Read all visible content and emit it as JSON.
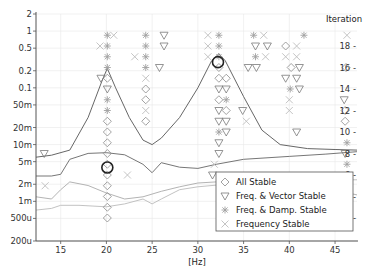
{
  "chart_data": {
    "type": "scatter",
    "title": "",
    "xlabel": "[Hz]",
    "ylabel": "",
    "y2label": "Iteration",
    "xlim": [
      12.3,
      47.4
    ],
    "ylim_log": [
      0.0002,
      2
    ],
    "y2lim": [
      0,
      20
    ],
    "grid": true,
    "legend_position": "lower right (inside)",
    "x_ticks": [
      15,
      20,
      25,
      30,
      35,
      40,
      45
    ],
    "x_tick_labels": [
      "15",
      "20",
      "25",
      "30",
      "35",
      "40",
      "45"
    ],
    "y_ticks": [
      2,
      1,
      0.5,
      0.2,
      0.1,
      0.05,
      0.02,
      0.01,
      0.005,
      0.002,
      0.001,
      0.0005,
      0.0002
    ],
    "y_tick_labels": [
      "2",
      "1",
      "0.5",
      "0.2",
      "0.1",
      "50m",
      "20m",
      "10m",
      "5m",
      "2m",
      "1m",
      "500u",
      "200u"
    ],
    "y2_ticks": [
      2,
      4,
      6,
      8,
      10,
      12,
      14,
      16,
      18
    ],
    "y2_tick_labels": [
      "2 -",
      "4 -",
      "6 -",
      "8 -",
      "10 -",
      "12 -",
      "14 -",
      "16 -",
      "18 -"
    ],
    "legend": [
      {
        "symbol": "diamond",
        "label": "All Stable"
      },
      {
        "symbol": "triangle-down",
        "label": "Freq. & Vector Stable"
      },
      {
        "symbol": "asterisk",
        "label": "Freq. & Damp. Stable"
      },
      {
        "symbol": "cross",
        "label": "Frequency Stable"
      }
    ],
    "curves": [
      {
        "name": "spectrum-1",
        "color": "#555555",
        "points": [
          [
            12.3,
            0.006
          ],
          [
            14,
            0.0065
          ],
          [
            16,
            0.008
          ],
          [
            18,
            0.03
          ],
          [
            19.5,
            0.13
          ],
          [
            20.1,
            0.22
          ],
          [
            21,
            0.1
          ],
          [
            22.5,
            0.03
          ],
          [
            24,
            0.012
          ],
          [
            25,
            0.01
          ],
          [
            26,
            0.013
          ],
          [
            28,
            0.03
          ],
          [
            30,
            0.1
          ],
          [
            31.5,
            0.3
          ],
          [
            32.3,
            0.4
          ],
          [
            33,
            0.3
          ],
          [
            35,
            0.07
          ],
          [
            37,
            0.018
          ],
          [
            39,
            0.01
          ],
          [
            42,
            0.0085
          ],
          [
            45,
            0.0082
          ],
          [
            47.4,
            0.008
          ]
        ]
      },
      {
        "name": "spectrum-2",
        "color": "#666666",
        "points": [
          [
            12.3,
            0.0028
          ],
          [
            14,
            0.0028
          ],
          [
            15,
            0.003
          ],
          [
            16,
            0.0055
          ],
          [
            18,
            0.007
          ],
          [
            20,
            0.0072
          ],
          [
            22,
            0.0066
          ],
          [
            24,
            0.0045
          ],
          [
            25,
            0.0032
          ],
          [
            26,
            0.0048
          ],
          [
            28,
            0.004
          ],
          [
            30,
            0.0038
          ],
          [
            32,
            0.0045
          ],
          [
            35,
            0.0055
          ],
          [
            40,
            0.0062
          ],
          [
            44,
            0.0068
          ],
          [
            47.4,
            0.0075
          ]
        ]
      },
      {
        "name": "spectrum-3",
        "color": "#aaaaaa",
        "points": [
          [
            12.3,
            0.0012
          ],
          [
            14,
            0.0011
          ],
          [
            15,
            0.0016
          ],
          [
            16,
            0.0022
          ],
          [
            18,
            0.0019
          ],
          [
            20,
            0.0014
          ],
          [
            22,
            0.0011
          ],
          [
            24,
            0.0012
          ],
          [
            26,
            0.0015
          ],
          [
            28,
            0.0018
          ],
          [
            30,
            0.0021
          ],
          [
            32,
            0.0022
          ],
          [
            35,
            0.0023
          ],
          [
            40,
            0.0022
          ],
          [
            44,
            0.0017
          ],
          [
            47.4,
            0.0013
          ]
        ]
      },
      {
        "name": "spectrum-4",
        "color": "#bbbbbb",
        "points": [
          [
            12.3,
            0.0007
          ],
          [
            14,
            0.00075
          ],
          [
            15,
            0.00085
          ],
          [
            17,
            0.00085
          ],
          [
            20,
            0.0008
          ],
          [
            22,
            0.0009
          ],
          [
            24,
            0.0011
          ],
          [
            25,
            0.0009
          ],
          [
            26,
            0.0011
          ],
          [
            28,
            0.0016
          ],
          [
            30,
            0.0018
          ],
          [
            33,
            0.002
          ],
          [
            36,
            0.0022
          ],
          [
            40,
            0.0023
          ],
          [
            44,
            0.0024
          ],
          [
            47.4,
            0.0024
          ]
        ]
      }
    ],
    "stable_points": [
      {
        "x": 20.1,
        "iter": 19,
        "symbol": "asterisk"
      },
      {
        "x": 20.1,
        "iter": 18,
        "symbol": "asterisk"
      },
      {
        "x": 20.1,
        "iter": 17,
        "symbol": "asterisk"
      },
      {
        "x": 20.1,
        "iter": 16,
        "symbol": "asterisk"
      },
      {
        "x": 20.1,
        "iter": 15,
        "symbol": "diamond"
      },
      {
        "x": 20.1,
        "iter": 14,
        "symbol": "triangle-down"
      },
      {
        "x": 20.1,
        "iter": 13,
        "symbol": "asterisk"
      },
      {
        "x": 20.1,
        "iter": 12,
        "symbol": "asterisk"
      },
      {
        "x": 20.1,
        "iter": 11,
        "symbol": "diamond"
      },
      {
        "x": 20.1,
        "iter": 10,
        "symbol": "diamond"
      },
      {
        "x": 20.1,
        "iter": 9,
        "symbol": "diamond"
      },
      {
        "x": 20.1,
        "iter": 8,
        "symbol": "diamond"
      },
      {
        "x": 20.1,
        "iter": 7,
        "symbol": "diamond"
      },
      {
        "x": 20.1,
        "iter": 6,
        "symbol": "diamond"
      },
      {
        "x": 20.1,
        "iter": 5,
        "symbol": "diamond"
      },
      {
        "x": 20.1,
        "iter": 4,
        "symbol": "diamond"
      },
      {
        "x": 20.1,
        "iter": 3,
        "symbol": "diamond"
      },
      {
        "x": 20.1,
        "iter": 2,
        "symbol": "diamond"
      },
      {
        "x": 19.3,
        "iter": 18,
        "symbol": "cross"
      },
      {
        "x": 20.8,
        "iter": 19,
        "symbol": "cross"
      },
      {
        "x": 19.4,
        "iter": 15,
        "symbol": "triangle-down"
      },
      {
        "x": 24.3,
        "iter": 19,
        "symbol": "asterisk"
      },
      {
        "x": 24.3,
        "iter": 18,
        "symbol": "asterisk"
      },
      {
        "x": 24.3,
        "iter": 17,
        "symbol": "asterisk"
      },
      {
        "x": 24.3,
        "iter": 16,
        "symbol": "asterisk"
      },
      {
        "x": 24.3,
        "iter": 15,
        "symbol": "cross"
      },
      {
        "x": 24.3,
        "iter": 14,
        "symbol": "diamond"
      },
      {
        "x": 24.3,
        "iter": 13,
        "symbol": "diamond"
      },
      {
        "x": 24.3,
        "iter": 12,
        "symbol": "cross"
      },
      {
        "x": 24.3,
        "iter": 11,
        "symbol": "diamond"
      },
      {
        "x": 23.1,
        "iter": 17,
        "symbol": "cross"
      },
      {
        "x": 26.3,
        "iter": 19,
        "symbol": "triangle-down"
      },
      {
        "x": 26.3,
        "iter": 18,
        "symbol": "triangle-down"
      },
      {
        "x": 25.8,
        "iter": 16,
        "symbol": "triangle-down"
      },
      {
        "x": 22.3,
        "iter": 6,
        "symbol": "cross"
      },
      {
        "x": 13.2,
        "iter": 8,
        "symbol": "triangle-down"
      },
      {
        "x": 13.3,
        "iter": 5,
        "symbol": "cross"
      },
      {
        "x": 32.3,
        "iter": 19,
        "symbol": "asterisk"
      },
      {
        "x": 32.3,
        "iter": 18,
        "symbol": "asterisk"
      },
      {
        "x": 32.3,
        "iter": 17,
        "symbol": "asterisk"
      },
      {
        "x": 32.3,
        "iter": 16,
        "symbol": "diamond"
      },
      {
        "x": 32.3,
        "iter": 15,
        "symbol": "diamond"
      },
      {
        "x": 32.3,
        "iter": 14,
        "symbol": "triangle-down"
      },
      {
        "x": 32.3,
        "iter": 13,
        "symbol": "diamond"
      },
      {
        "x": 32.3,
        "iter": 12,
        "symbol": "triangle-down"
      },
      {
        "x": 32.3,
        "iter": 11,
        "symbol": "triangle-down"
      },
      {
        "x": 32.3,
        "iter": 10,
        "symbol": "asterisk"
      },
      {
        "x": 32.3,
        "iter": 9,
        "symbol": "triangle-down"
      },
      {
        "x": 32.3,
        "iter": 8,
        "symbol": "triangle-down"
      },
      {
        "x": 31.8,
        "iter": 7,
        "symbol": "cross"
      },
      {
        "x": 31.6,
        "iter": 6,
        "symbol": "triangle-down"
      },
      {
        "x": 31.1,
        "iter": 19,
        "symbol": "cross"
      },
      {
        "x": 31.1,
        "iter": 18,
        "symbol": "cross"
      },
      {
        "x": 31.1,
        "iter": 17,
        "symbol": "cross"
      },
      {
        "x": 33.1,
        "iter": 15,
        "symbol": "diamond"
      },
      {
        "x": 33.1,
        "iter": 14,
        "symbol": "triangle-down"
      },
      {
        "x": 33.1,
        "iter": 13,
        "symbol": "asterisk"
      },
      {
        "x": 33.1,
        "iter": 12,
        "symbol": "diamond"
      },
      {
        "x": 33.1,
        "iter": 11,
        "symbol": "triangle-down"
      },
      {
        "x": 33.1,
        "iter": 10,
        "symbol": "triangle-down"
      },
      {
        "x": 34.9,
        "iter": 12,
        "symbol": "triangle-down"
      },
      {
        "x": 35.3,
        "iter": 11,
        "symbol": "cross"
      },
      {
        "x": 36.1,
        "iter": 19,
        "symbol": "asterisk"
      },
      {
        "x": 37.2,
        "iter": 19,
        "symbol": "cross"
      },
      {
        "x": 36.3,
        "iter": 18,
        "symbol": "triangle-down"
      },
      {
        "x": 37.6,
        "iter": 18,
        "symbol": "triangle-down"
      },
      {
        "x": 36.3,
        "iter": 17,
        "symbol": "asterisk"
      },
      {
        "x": 37.4,
        "iter": 17,
        "symbol": "cross"
      },
      {
        "x": 35.5,
        "iter": 16,
        "symbol": "triangle-down"
      },
      {
        "x": 36.4,
        "iter": 16,
        "symbol": "triangle-down"
      },
      {
        "x": 39.6,
        "iter": 18,
        "symbol": "diamond"
      },
      {
        "x": 40.8,
        "iter": 18,
        "symbol": "cross"
      },
      {
        "x": 39.6,
        "iter": 17,
        "symbol": "cross"
      },
      {
        "x": 40.8,
        "iter": 17,
        "symbol": "cross"
      },
      {
        "x": 40.2,
        "iter": 16,
        "symbol": "diamond"
      },
      {
        "x": 41.1,
        "iter": 16,
        "symbol": "triangle-down"
      },
      {
        "x": 39.6,
        "iter": 15,
        "symbol": "triangle-down"
      },
      {
        "x": 40.8,
        "iter": 15,
        "symbol": "triangle-down"
      },
      {
        "x": 40.1,
        "iter": 14,
        "symbol": "asterisk"
      },
      {
        "x": 41.1,
        "iter": 14,
        "symbol": "triangle-down"
      },
      {
        "x": 40.0,
        "iter": 13,
        "symbol": "cross"
      },
      {
        "x": 40.0,
        "iter": 12,
        "symbol": "cross"
      },
      {
        "x": 41.6,
        "iter": 19,
        "symbol": "asterisk"
      },
      {
        "x": 40.8,
        "iter": 10,
        "symbol": "triangle-down"
      },
      {
        "x": 46.3,
        "iter": 19,
        "symbol": "cross"
      },
      {
        "x": 46.2,
        "iter": 16,
        "symbol": "diamond"
      },
      {
        "x": 46.0,
        "iter": 13,
        "symbol": "triangle-down"
      },
      {
        "x": 46.1,
        "iter": 12,
        "symbol": "diamond"
      },
      {
        "x": 46.1,
        "iter": 11,
        "symbol": "diamond"
      },
      {
        "x": 46.3,
        "iter": 9,
        "symbol": "asterisk"
      },
      {
        "x": 46.3,
        "iter": 7,
        "symbol": "asterisk"
      },
      {
        "x": 46.1,
        "iter": 8,
        "symbol": "triangle-down"
      }
    ],
    "highlighted_modes": [
      {
        "x": 20.1,
        "iter": 6.7,
        "label": "selected-mode-1"
      },
      {
        "x": 32.2,
        "iter": 16.5,
        "label": "selected-mode-2"
      }
    ]
  }
}
